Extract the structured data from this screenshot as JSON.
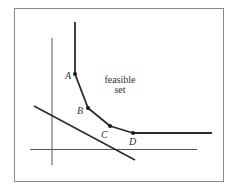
{
  "diagram": {
    "title": "",
    "region_label_line1": "feasible",
    "region_label_line2": "set",
    "points": [
      {
        "label": "A",
        "x": 75,
        "y": 74
      },
      {
        "label": "B",
        "x": 88,
        "y": 108
      },
      {
        "label": "C",
        "x": 110,
        "y": 126
      },
      {
        "label": "D",
        "x": 133,
        "y": 133
      }
    ],
    "colors": {
      "frame": "#8a8a8a",
      "axis": "#555555",
      "boundary": "#2a2a2a",
      "text": "#333333"
    }
  }
}
